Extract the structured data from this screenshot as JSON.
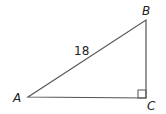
{
  "diagram": {
    "type": "right-triangle",
    "vertices": {
      "A": {
        "label": "A",
        "x": 28,
        "y": 97
      },
      "B": {
        "label": "B",
        "x": 146,
        "y": 20
      },
      "C": {
        "label": "C",
        "x": 146,
        "y": 98
      }
    },
    "sides": {
      "AB": {
        "label": "18"
      }
    },
    "right_angle_at": "C",
    "colors": {
      "stroke": "#444444",
      "text": "#222222"
    }
  }
}
